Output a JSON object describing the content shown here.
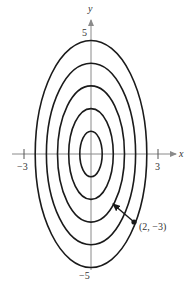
{
  "figure": {
    "axes": {
      "x_label": "x",
      "y_label": "y",
      "x_ticks": [
        {
          "value": -3,
          "label": "−3"
        },
        {
          "value": 3,
          "label": "3"
        }
      ],
      "y_ticks": [
        {
          "value": 5,
          "label": "5"
        },
        {
          "value": -5,
          "label": "−5"
        }
      ],
      "xlim": [
        -4,
        4
      ],
      "ylim": [
        -5.5,
        5.8
      ]
    },
    "curves": [
      {
        "level": 1,
        "semi_axis_x": 0.5,
        "semi_axis_y": 1
      },
      {
        "level": 2,
        "semi_axis_x": 1.0,
        "semi_axis_y": 2
      },
      {
        "level": 3,
        "semi_axis_x": 1.5,
        "semi_axis_y": 3
      },
      {
        "level": 4,
        "semi_axis_x": 2.0,
        "semi_axis_y": 4
      },
      {
        "level": 5,
        "semi_axis_x": 2.5,
        "semi_axis_y": 5
      }
    ],
    "point": {
      "x": 2,
      "y": -3,
      "label": "(2, −3)"
    },
    "arrow": {
      "from": [
        2,
        -3
      ],
      "direction": "toward smaller level curves (up-left)"
    },
    "colors": {
      "curve": "#1a1a1a",
      "axis": "#8a8a8a",
      "text": "#333333",
      "background": "#ffffff"
    }
  }
}
